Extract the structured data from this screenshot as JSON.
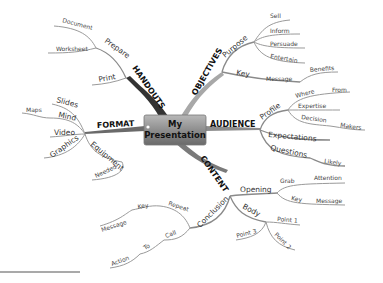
{
  "center": {
    "line1": "My",
    "line2": "Presentation"
  },
  "branches": {
    "handouts": {
      "label": "HANDOUTS",
      "prepare": "Prepare",
      "document": "Document",
      "worksheet": "Worksheet",
      "print": "Print"
    },
    "objectives": {
      "label": "OBJECTIVES",
      "purpose": "Purpose",
      "sell": "Sell",
      "inform": "Inform",
      "persuade": "Persuade",
      "entertain": "Entertain",
      "key": "Key",
      "message": "Message",
      "benefits": "Benefits"
    },
    "audience": {
      "label": "AUDIENCE",
      "profile": "Profile",
      "where": "Where",
      "from": "From",
      "expertise": "Expertise",
      "decision": "Decision",
      "makers": "Makers",
      "expectations": "Expectations",
      "questions": "Questions",
      "likely": "Likely"
    },
    "content": {
      "label": "CONTENT",
      "opening": "Opening",
      "grab": "Grab",
      "attention": "Attention",
      "key": "Key",
      "message": "Message",
      "body": "Body",
      "point1": "Point 1",
      "point2": "Point 2",
      "point3": "Point 3",
      "conclusion": "Conclusion",
      "repeat": "Repeat",
      "key2": "Key",
      "message2": "Message",
      "call": "Call",
      "to": "To",
      "action": "Action"
    },
    "format": {
      "label": "FORMAT",
      "slides": "Slides",
      "mind": "Mind",
      "maps": "Maps",
      "video": "Video",
      "graphics": "Graphics",
      "equipment": "Equipment",
      "needed": "Needed"
    }
  },
  "colors": {
    "handouts": "#3a3a3a",
    "objectives": "#9a9a9a",
    "audience": "#8c8c8c",
    "content": "#7a7a7a",
    "format": "#6e6e6e",
    "center": "#8a8a8a"
  }
}
